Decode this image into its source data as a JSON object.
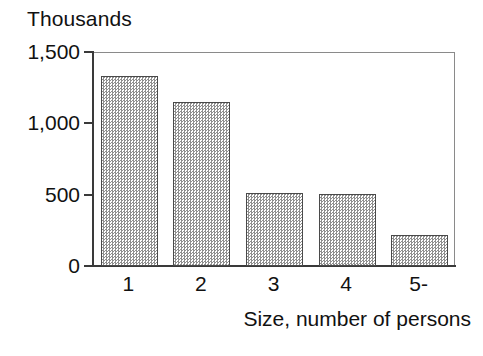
{
  "chart_data": {
    "type": "bar",
    "title": "",
    "subtitle": "",
    "categories": [
      "1",
      "2",
      "3",
      "4",
      "5-"
    ],
    "values": [
      1330,
      1150,
      510,
      505,
      220
    ],
    "series": [
      {
        "name": "Households",
        "values": [
          1330,
          1150,
          510,
          505,
          220
        ]
      }
    ],
    "xlabel": "Size, number of persons",
    "ylabel": "Thousands",
    "y_unit_caption": "Thousands",
    "ylim": [
      0,
      1500
    ],
    "ytick_values": [
      0,
      500,
      1000,
      1500
    ],
    "ytick_labels": [
      "0",
      "500",
      "1,000",
      "1,500"
    ],
    "xtick_labels": [
      "1",
      "2",
      "3",
      "4",
      "5-"
    ],
    "grid": false,
    "legend": false,
    "legend_position": "none",
    "bar_fill": "#8f8f8f",
    "bar_fill_style": "50% checkerboard dither gray",
    "bar_edge_color": "#4a4a4a",
    "axis_color": "#3a3a3a",
    "frame_color": "#8a8a8a",
    "background_color": "#ffffff",
    "text_color": "#111111"
  },
  "axes": {
    "y_unit_caption": "Thousands",
    "x_title": "Size, number of persons"
  },
  "y_ticks": [
    {
      "label": "1,500",
      "value": 1500
    },
    {
      "label": "1,000",
      "value": 1000
    },
    {
      "label": "500",
      "value": 500
    },
    {
      "label": "0",
      "value": 0
    }
  ],
  "x_ticks": [
    {
      "label": "1"
    },
    {
      "label": "2"
    },
    {
      "label": "3"
    },
    {
      "label": "4"
    },
    {
      "label": "5-"
    }
  ],
  "bars": [
    {
      "category": "1",
      "value": 1330
    },
    {
      "category": "2",
      "value": 1150
    },
    {
      "category": "3",
      "value": 510
    },
    {
      "category": "4",
      "value": 505
    },
    {
      "category": "5-",
      "value": 220
    }
  ]
}
